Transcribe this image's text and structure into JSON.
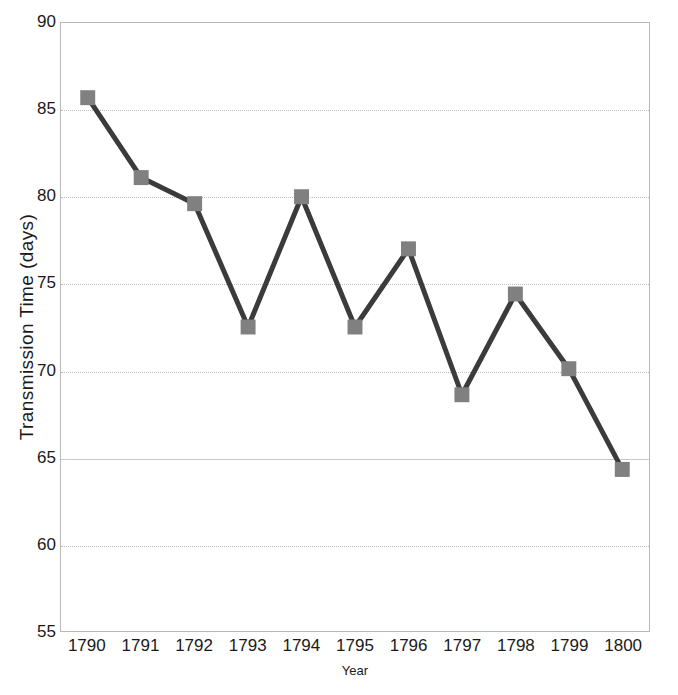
{
  "chart_data": {
    "type": "line",
    "title": "",
    "xlabel": "Year",
    "ylabel": "Transmission Time (days)",
    "categories": [
      "1790",
      "1791",
      "1792",
      "1793",
      "1794",
      "1795",
      "1796",
      "1797",
      "1798",
      "1799",
      "1800"
    ],
    "x": [
      1790,
      1791,
      1792,
      1793,
      1794,
      1795,
      1796,
      1797,
      1798,
      1799,
      1800
    ],
    "values": [
      85.7,
      81.1,
      79.6,
      72.5,
      80.0,
      72.5,
      77.0,
      68.6,
      74.4,
      70.1,
      64.3
    ],
    "series": [
      {
        "name": "Transmission Time",
        "values": [
          85.7,
          81.1,
          79.6,
          72.5,
          80.0,
          72.5,
          77.0,
          68.6,
          74.4,
          70.1,
          64.3
        ],
        "line_color": "#3b3b3b",
        "marker_color": "#808080",
        "marker": "square"
      }
    ],
    "ylim": [
      55,
      90
    ],
    "yticks": [
      55,
      60,
      65,
      70,
      75,
      80,
      85,
      90
    ],
    "ytick_labels": [
      "55",
      "60",
      "65",
      "70",
      "75",
      "80",
      "85",
      "90"
    ],
    "xlim": [
      1789.5,
      1800.5
    ],
    "grid": "horizontal-dotted",
    "legend": "none",
    "colors": {
      "line": "#3b3b3b",
      "marker": "#808080",
      "gridline": "#bdbdbd",
      "frame": "#b9b9b9",
      "text": "#1a1a1a",
      "background": "#ffffff"
    }
  }
}
